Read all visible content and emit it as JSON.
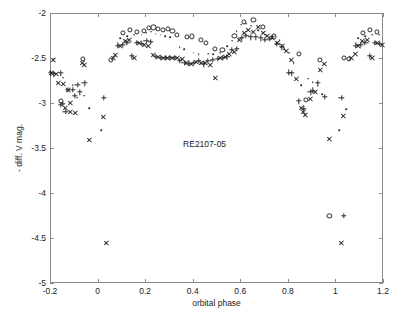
{
  "figure": {
    "width": 403,
    "height": 320,
    "background": "#ffffff",
    "axis_color": "#8a8a8a",
    "marker_color": "#2b2b2b",
    "plot_box": {
      "left": 50,
      "top": 13,
      "right": 383,
      "bottom": 283
    }
  },
  "chart_data": {
    "type": "scatter",
    "title": "",
    "subtitle": "",
    "xlabel": "orbital phase",
    "ylabel": "- diff. V mag.",
    "xlim": [
      -0.2,
      1.2
    ],
    "ylim": [
      -5,
      -2
    ],
    "xticks": [
      -0.2,
      0,
      0.2,
      0.4,
      0.6,
      0.8,
      1,
      1.2
    ],
    "xticklabels": [
      "-0.2",
      "0",
      "0.2",
      "0.4",
      "0.6",
      "0.8",
      "1",
      "1.2"
    ],
    "yticks": [
      -5,
      -4.5,
      -4,
      -3.5,
      -3,
      -2.5,
      -2
    ],
    "yticklabels": [
      "-5",
      "-4.5",
      "-4",
      "-3.5",
      "-3",
      "-2.5",
      "-2"
    ],
    "grid": false,
    "legend": "none",
    "annotations": [
      {
        "text": "RE2107-05",
        "x": 0.45,
        "y": -3.45
      }
    ],
    "series": [
      {
        "name": "circle-series",
        "marker": "o",
        "points": [
          [
            -0.155,
            -2.98
          ],
          [
            -0.06,
            -2.51
          ],
          [
            0.055,
            -2.52
          ],
          [
            0.105,
            -2.22
          ],
          [
            0.135,
            -2.19
          ],
          [
            0.165,
            -2.21
          ],
          [
            0.195,
            -2.2
          ],
          [
            0.215,
            -2.17
          ],
          [
            0.235,
            -2.16
          ],
          [
            0.255,
            -2.18
          ],
          [
            0.275,
            -2.19
          ],
          [
            0.295,
            -2.18
          ],
          [
            0.315,
            -2.2
          ],
          [
            0.335,
            -2.24
          ],
          [
            0.375,
            -2.27
          ],
          [
            0.395,
            -2.26
          ],
          [
            0.435,
            -2.3
          ],
          [
            0.455,
            -2.33
          ],
          [
            0.495,
            -2.4
          ],
          [
            0.525,
            -2.41
          ],
          [
            0.575,
            -2.25
          ],
          [
            0.615,
            -2.1
          ],
          [
            0.655,
            -2.08
          ],
          [
            0.695,
            -2.15
          ],
          [
            0.74,
            -2.26
          ],
          [
            0.845,
            -2.45
          ],
          [
            0.875,
            -2.97
          ],
          [
            0.935,
            -2.52
          ],
          [
            0.975,
            -4.25
          ],
          [
            1.035,
            -2.5
          ],
          [
            1.055,
            -2.51
          ],
          [
            1.115,
            -2.22
          ],
          [
            1.145,
            -2.19
          ],
          [
            1.175,
            -2.21
          ]
        ]
      },
      {
        "name": "plus-series",
        "marker": "+",
        "points": [
          [
            -0.195,
            -2.67
          ],
          [
            -0.185,
            -2.68
          ],
          [
            -0.155,
            -2.67
          ],
          [
            -0.125,
            -2.85
          ],
          [
            -0.105,
            -2.85
          ],
          [
            -0.085,
            -2.8
          ],
          [
            -0.145,
            -3.01
          ],
          [
            -0.155,
            -3.02
          ],
          [
            -0.135,
            -3.1
          ],
          [
            -0.095,
            -2.92
          ],
          [
            -0.075,
            -2.88
          ],
          [
            -0.055,
            -2.78
          ],
          [
            0.025,
            -2.94
          ],
          [
            0.085,
            -2.36
          ],
          [
            0.105,
            -2.35
          ],
          [
            0.125,
            -2.33
          ],
          [
            0.145,
            -2.48
          ],
          [
            0.165,
            -2.33
          ],
          [
            0.185,
            -2.34
          ],
          [
            0.205,
            -2.31
          ],
          [
            0.225,
            -2.32
          ],
          [
            0.245,
            -2.49
          ],
          [
            0.265,
            -2.5
          ],
          [
            0.285,
            -2.5
          ],
          [
            0.305,
            -2.5
          ],
          [
            0.325,
            -2.5
          ],
          [
            0.345,
            -2.53
          ],
          [
            0.365,
            -2.55
          ],
          [
            0.385,
            -2.56
          ],
          [
            0.405,
            -2.55
          ],
          [
            0.425,
            -2.53
          ],
          [
            0.445,
            -2.57
          ],
          [
            0.465,
            -2.53
          ],
          [
            0.485,
            -2.52
          ],
          [
            0.505,
            -2.51
          ],
          [
            0.525,
            -2.5
          ],
          [
            0.545,
            -2.49
          ],
          [
            0.565,
            -2.41
          ],
          [
            0.585,
            -2.4
          ],
          [
            0.605,
            -2.28
          ],
          [
            0.625,
            -2.25
          ],
          [
            0.645,
            -2.27
          ],
          [
            0.665,
            -2.27
          ],
          [
            0.685,
            -2.28
          ],
          [
            0.705,
            -2.3
          ],
          [
            0.725,
            -2.29
          ],
          [
            0.755,
            -2.34
          ],
          [
            0.775,
            -2.38
          ],
          [
            0.805,
            -2.66
          ],
          [
            0.815,
            -2.67
          ],
          [
            0.845,
            -2.98
          ],
          [
            0.865,
            -3.06
          ],
          [
            0.895,
            -2.88
          ],
          [
            0.905,
            -2.86
          ],
          [
            0.925,
            -2.78
          ],
          [
            0.955,
            -2.93
          ],
          [
            1.025,
            -2.94
          ],
          [
            1.035,
            -4.25
          ],
          [
            1.085,
            -2.36
          ],
          [
            1.105,
            -2.35
          ],
          [
            1.125,
            -2.33
          ],
          [
            1.145,
            -2.48
          ],
          [
            1.165,
            -2.33
          ],
          [
            1.185,
            -2.34
          ]
        ]
      },
      {
        "name": "cross-series",
        "marker": "x",
        "points": [
          [
            -0.185,
            -2.52
          ],
          [
            -0.195,
            -2.67
          ],
          [
            -0.175,
            -2.68
          ],
          [
            -0.165,
            -2.78
          ],
          [
            -0.145,
            -2.79
          ],
          [
            -0.125,
            -2.86
          ],
          [
            -0.115,
            -3.0
          ],
          [
            -0.135,
            -3.06
          ],
          [
            -0.115,
            -3.1
          ],
          [
            -0.095,
            -3.11
          ],
          [
            -0.065,
            -2.55
          ],
          [
            -0.055,
            -2.58
          ],
          [
            -0.035,
            -3.41
          ],
          [
            0.025,
            -3.15
          ],
          [
            0.035,
            -4.56
          ],
          [
            0.065,
            -2.5
          ],
          [
            0.075,
            -2.47
          ],
          [
            0.095,
            -2.37
          ],
          [
            0.115,
            -2.31
          ],
          [
            0.135,
            -2.3
          ],
          [
            0.155,
            -2.5
          ],
          [
            0.175,
            -2.33
          ],
          [
            0.195,
            -2.36
          ],
          [
            0.215,
            -2.37
          ],
          [
            0.235,
            -2.47
          ],
          [
            0.255,
            -2.49
          ],
          [
            0.275,
            -2.5
          ],
          [
            0.295,
            -2.5
          ],
          [
            0.315,
            -2.5
          ],
          [
            0.335,
            -2.5
          ],
          [
            0.355,
            -2.51
          ],
          [
            0.375,
            -2.56
          ],
          [
            0.395,
            -2.57
          ],
          [
            0.415,
            -2.54
          ],
          [
            0.435,
            -2.55
          ],
          [
            0.455,
            -2.56
          ],
          [
            0.475,
            -2.58
          ],
          [
            0.495,
            -2.72
          ],
          [
            0.515,
            -2.5
          ],
          [
            0.535,
            -2.49
          ],
          [
            0.555,
            -2.45
          ],
          [
            0.575,
            -2.43
          ],
          [
            0.595,
            -2.3
          ],
          [
            0.615,
            -2.22
          ],
          [
            0.635,
            -2.19
          ],
          [
            0.655,
            -2.21
          ],
          [
            0.675,
            -2.16
          ],
          [
            0.695,
            -2.22
          ],
          [
            0.715,
            -2.26
          ],
          [
            0.735,
            -2.28
          ],
          [
            0.755,
            -2.33
          ],
          [
            0.775,
            -2.37
          ],
          [
            0.795,
            -2.42
          ],
          [
            0.815,
            -2.52
          ],
          [
            0.835,
            -2.73
          ],
          [
            0.855,
            -3.06
          ],
          [
            0.865,
            -3.1
          ],
          [
            0.875,
            -3.13
          ],
          [
            0.895,
            -2.95
          ],
          [
            0.915,
            -2.88
          ],
          [
            0.935,
            -2.63
          ],
          [
            0.955,
            -2.57
          ],
          [
            0.975,
            -3.4
          ],
          [
            1.025,
            -4.56
          ],
          [
            1.035,
            -3.14
          ],
          [
            1.065,
            -2.5
          ],
          [
            1.085,
            -2.45
          ],
          [
            1.095,
            -2.37
          ],
          [
            1.115,
            -2.31
          ],
          [
            1.135,
            -2.3
          ],
          [
            1.155,
            -2.5
          ],
          [
            1.175,
            -2.33
          ],
          [
            1.195,
            -2.36
          ]
        ]
      },
      {
        "name": "dot-series",
        "marker": ".",
        "points": [
          [
            -0.145,
            -2.72
          ],
          [
            -0.105,
            -2.8
          ],
          [
            -0.085,
            -2.94
          ],
          [
            -0.055,
            -2.92
          ],
          [
            -0.035,
            -3.06
          ],
          [
            0.015,
            -3.3
          ],
          [
            0.095,
            -2.28
          ],
          [
            0.125,
            -2.26
          ],
          [
            0.155,
            -2.24
          ],
          [
            0.185,
            -2.24
          ],
          [
            0.205,
            -2.22
          ],
          [
            0.225,
            -2.21
          ],
          [
            0.245,
            -2.23
          ],
          [
            0.265,
            -2.24
          ],
          [
            0.285,
            -2.26
          ],
          [
            0.305,
            -2.27
          ],
          [
            0.345,
            -2.38
          ],
          [
            0.365,
            -2.4
          ],
          [
            0.405,
            -2.44
          ],
          [
            0.425,
            -2.46
          ],
          [
            0.465,
            -2.45
          ],
          [
            0.485,
            -2.46
          ],
          [
            0.515,
            -2.44
          ],
          [
            0.545,
            -2.37
          ],
          [
            0.565,
            -2.31
          ],
          [
            0.585,
            -2.2
          ],
          [
            0.605,
            -2.13
          ],
          [
            0.625,
            -2.12
          ],
          [
            0.645,
            -2.14
          ],
          [
            0.675,
            -2.19
          ],
          [
            0.705,
            -2.24
          ],
          [
            0.735,
            -2.26
          ],
          [
            0.765,
            -2.3
          ],
          [
            0.785,
            -2.4
          ],
          [
            0.805,
            -2.44
          ],
          [
            0.825,
            -2.56
          ],
          [
            0.855,
            -2.8
          ],
          [
            0.885,
            -2.73
          ],
          [
            0.905,
            -2.77
          ],
          [
            0.925,
            -2.81
          ],
          [
            0.945,
            -2.9
          ],
          [
            1.015,
            -3.3
          ],
          [
            1.045,
            -3.07
          ],
          [
            1.095,
            -2.28
          ],
          [
            1.125,
            -2.26
          ],
          [
            1.155,
            -2.24
          ],
          [
            1.185,
            -2.24
          ]
        ]
      }
    ]
  }
}
